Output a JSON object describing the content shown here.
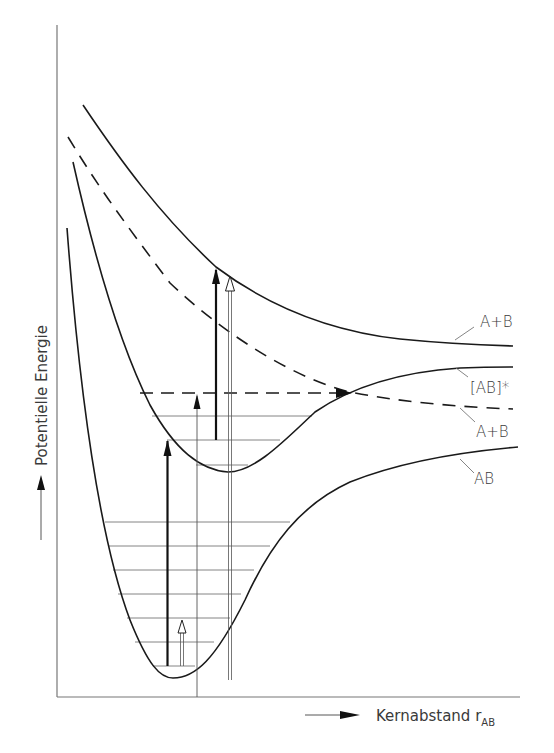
{
  "diagram": {
    "type": "potential-energy-curves",
    "y_axis_label": "Potentielle Energie",
    "x_axis_label": "Kernabstand r",
    "x_axis_subscript": "AB",
    "curve_labels": {
      "upper": "A+B",
      "middle": "[AB]*",
      "dashed": "A+B",
      "lower": "AB"
    },
    "curves": [
      {
        "name": "upper-repulsive",
        "style": "solid",
        "asymptote_label": "A+B"
      },
      {
        "name": "excited-bound",
        "style": "solid",
        "asymptote_label": "[AB]*"
      },
      {
        "name": "dashed-repulsive",
        "style": "dashed",
        "asymptote_label": "A+B"
      },
      {
        "name": "ground-state",
        "style": "solid",
        "asymptote_label": "AB"
      }
    ],
    "ground_vibrational_levels": 7,
    "excited_vibrational_levels": 3,
    "colors": {
      "line": "#1a1a1a",
      "thin": "#555555",
      "text": "#3a3a3a"
    }
  }
}
